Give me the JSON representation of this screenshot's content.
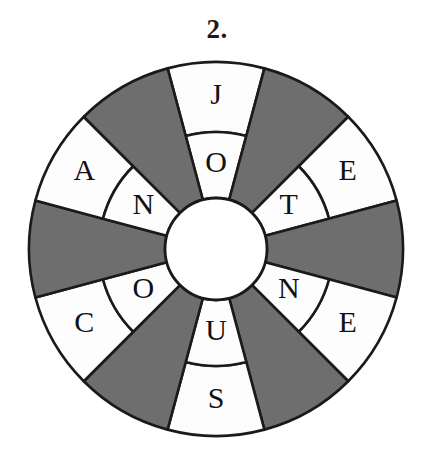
{
  "title": "2.",
  "wheel": {
    "type": "letter-wheel-puzzle",
    "sector_count": 12,
    "sector_angle_deg": 30,
    "ring_count": 2,
    "geometry": {
      "center_x": 216,
      "center_y": 249,
      "outer_radius": 187,
      "middle_radius": 117,
      "hub_radius": 51
    },
    "colors": {
      "shaded": "#6e6e6e",
      "blank": "#fdfdfd",
      "stroke": "#1a1a1a",
      "hub": "#ffffff",
      "letter": "#111111",
      "background": "#ffffff"
    },
    "sectors": [
      {
        "index": 0,
        "start_deg": -15,
        "shaded": false,
        "outer_letter": "J",
        "inner_letter": "O"
      },
      {
        "index": 1,
        "start_deg": 15,
        "shaded": true,
        "outer_letter": "",
        "inner_letter": ""
      },
      {
        "index": 2,
        "start_deg": 45,
        "shaded": false,
        "outer_letter": "E",
        "inner_letter": "T"
      },
      {
        "index": 3,
        "start_deg": 75,
        "shaded": true,
        "outer_letter": "",
        "inner_letter": ""
      },
      {
        "index": 4,
        "start_deg": 105,
        "shaded": false,
        "outer_letter": "E",
        "inner_letter": "N"
      },
      {
        "index": 5,
        "start_deg": 135,
        "shaded": true,
        "outer_letter": "",
        "inner_letter": ""
      },
      {
        "index": 6,
        "start_deg": 165,
        "shaded": false,
        "outer_letter": "S",
        "inner_letter": "U"
      },
      {
        "index": 7,
        "start_deg": 195,
        "shaded": true,
        "outer_letter": "",
        "inner_letter": ""
      },
      {
        "index": 8,
        "start_deg": 225,
        "shaded": false,
        "outer_letter": "C",
        "inner_letter": "O"
      },
      {
        "index": 9,
        "start_deg": 255,
        "shaded": true,
        "outer_letter": "",
        "inner_letter": ""
      },
      {
        "index": 10,
        "start_deg": 285,
        "shaded": false,
        "outer_letter": "A",
        "inner_letter": "N"
      },
      {
        "index": 11,
        "start_deg": 315,
        "shaded": true,
        "outer_letter": "",
        "inner_letter": ""
      }
    ],
    "outer_ring_letters": [
      "J",
      "E",
      "E",
      "S",
      "C",
      "A"
    ],
    "inner_ring_letters": [
      "O",
      "T",
      "N",
      "U",
      "O",
      "N"
    ]
  }
}
